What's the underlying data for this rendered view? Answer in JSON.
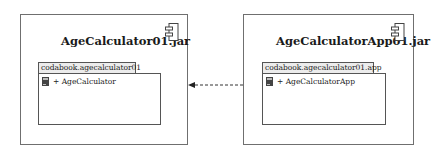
{
  "components": [
    {
      "title": "AgeCalculator01.jar",
      "package": {
        "name": "codabook.agecalculator01",
        "classes": [
          {
            "visibility": "+",
            "label": "+ AgeCalculator"
          }
        ]
      }
    },
    {
      "title": "AgeCalculatorApp01.jar",
      "package": {
        "name": "codabook.agecalculator01.app",
        "classes": [
          {
            "visibility": "+",
            "label": "+ AgeCalculatorApp"
          }
        ]
      }
    }
  ],
  "dependency": {
    "from": "AgeCalculatorApp01.jar",
    "to": "AgeCalculator01.jar",
    "style": "dashed"
  },
  "colors": {
    "border": "#6f6f6f",
    "tab_fill": "#ececec",
    "icon": "#444444"
  }
}
